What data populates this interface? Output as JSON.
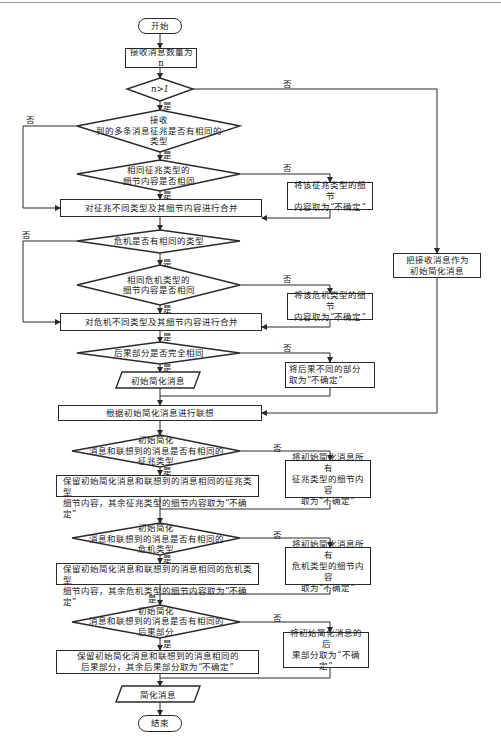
{
  "flowchart": {
    "start": "开始",
    "end": "结束",
    "steps": {
      "receive_count": "接收消息数量为n",
      "merge_signs": "对征兆不同类型及其细节内容进行合并",
      "merge_crisis": "对危机不同类型及其细节内容进行合并",
      "initial_as_is": [
        "把接收消息作为",
        "初始简化消息"
      ],
      "associate": "根据初始简化消息进行联想",
      "keep_sign_details": [
        "保留初始简化消息和联想到的消息相同的征兆类型",
        "细节内容，其余征兆类型的细节内容取为“不确定”"
      ],
      "keep_crisis_details": [
        "保留初始简化消息和联想到的消息相同的危机类型",
        "细节内容，其余危机类型的细节内容取为“不确定”"
      ],
      "keep_consequence": [
        "保留初始简化消息和联想到的消息相同的",
        "后果部分，其余后果部分取为“不确定”"
      ]
    },
    "side_steps": {
      "sign_uncertain": [
        "将该征兆类型的细节",
        "内容取为“不确定”"
      ],
      "crisis_uncertain": [
        "将该危机类型的细节",
        "内容取为“不确定”"
      ],
      "consequence_uncertain": [
        "将后果不同的部分",
        "取为“不确定”"
      ],
      "all_sign_uncertain": [
        "将初始简化消息所有",
        "征兆类型的细节内容",
        "取为“不确定”"
      ],
      "all_crisis_uncertain": [
        "将初始简化消息所有",
        "危机类型的细节内容",
        "取为“不确定”"
      ],
      "all_consequence_uncertain": [
        "将初始简化消息的后",
        "果部分取为“不确定”"
      ]
    },
    "decisions": {
      "n_gt_1": "n>1",
      "same_sign_type": [
        "接收",
        "到的多条消息征兆是否有相同的",
        "类型"
      ],
      "same_sign_detail": [
        "相同征兆类型的",
        "细节内容是否相同"
      ],
      "same_crisis_type": "危机是否有相同的类型",
      "same_crisis_detail": [
        "相同危机类型的",
        "细节内容是否相同"
      ],
      "same_consequence": "后果部分是否完全相同",
      "assoc_sign_type": [
        "初始简化",
        "消息和联想到的消息是否有相同的",
        "征兆类型"
      ],
      "assoc_crisis_type": [
        "初始简化",
        "消息和联想到的消息是否有相同的",
        "危机类型"
      ],
      "assoc_consequence": [
        "初始简化",
        "消息和联想到的消息是否有相同的",
        "后果部分"
      ]
    },
    "io": {
      "initial_message": "初始简化消息",
      "simplified_message": "简化消息"
    },
    "labels": {
      "yes": "是",
      "no": "否"
    },
    "colors": {
      "stroke": "#2a2a2a",
      "background": "#ffffff"
    }
  }
}
